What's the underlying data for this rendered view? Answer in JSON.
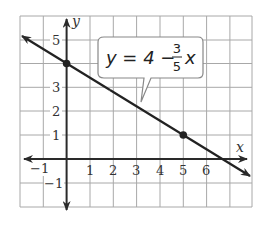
{
  "figure": {
    "type": "coordinate-plane-line-graph",
    "equation_label": {
      "prefix": "y = 4 −",
      "numerator": "3",
      "denominator": "5",
      "variable": "x"
    },
    "axes": {
      "x_label": "x",
      "y_label": "y",
      "x_range": [
        -2,
        8
      ],
      "y_range": [
        -2,
        6
      ],
      "x_ticks": [
        "−1",
        "1",
        "2",
        "3",
        "4",
        "5",
        "6"
      ],
      "y_ticks": [
        "5",
        "3",
        "2",
        "1",
        "−1"
      ]
    },
    "points": [
      {
        "x": 0,
        "y": 4
      },
      {
        "x": 5,
        "y": 1
      }
    ],
    "colors": {
      "grid": "#a8a8a8",
      "axis": "#333333",
      "line": "#222222",
      "callout_border": "#888888"
    }
  }
}
